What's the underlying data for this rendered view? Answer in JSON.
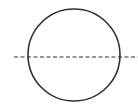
{
  "diagram": {
    "shapes": [
      {
        "kind": "circle",
        "name": "circle",
        "line_style": "solid",
        "color": "#333333"
      },
      {
        "kind": "line",
        "name": "dashed-line",
        "line_style": "dashed",
        "orientation": "horizontal",
        "color": "#333333"
      }
    ]
  }
}
